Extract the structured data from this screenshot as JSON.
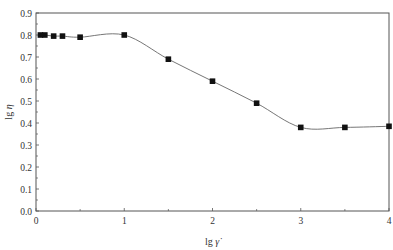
{
  "chart_data": {
    "type": "line",
    "title": "",
    "xlabel": "lg γ̇",
    "ylabel": "lg η",
    "xlim": [
      0,
      4
    ],
    "ylim": [
      0.0,
      0.9
    ],
    "x_ticks": [
      "0",
      "1",
      "2",
      "3",
      "4"
    ],
    "y_ticks": [
      "0.0",
      "0.1",
      "0.2",
      "0.3",
      "0.4",
      "0.5",
      "0.6",
      "0.7",
      "0.8",
      "0.9"
    ],
    "grid": false,
    "legend": null,
    "series": [
      {
        "name": "lg η",
        "marker": "filled-square",
        "line": "smooth",
        "x": [
          0.05,
          0.1,
          0.2,
          0.3,
          0.5,
          1.0,
          1.5,
          2.0,
          2.5,
          3.0,
          3.5,
          4.0
        ],
        "values": [
          0.8,
          0.8,
          0.795,
          0.795,
          0.79,
          0.8,
          0.69,
          0.59,
          0.49,
          0.38,
          0.38,
          0.385
        ]
      }
    ]
  },
  "axes": {
    "x_label_main": "lg",
    "x_label_symbol": "γ̇",
    "y_label_main": "lg",
    "y_label_symbol": "η"
  }
}
